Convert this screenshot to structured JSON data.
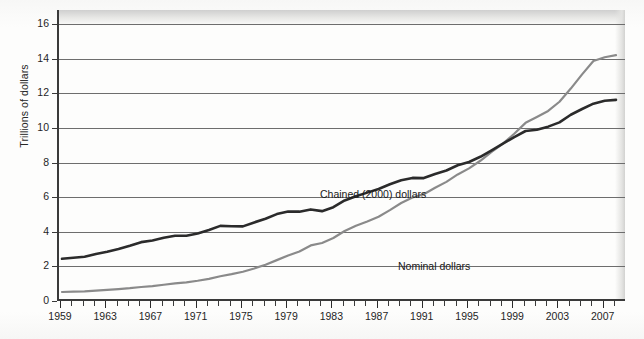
{
  "chart_data": {
    "type": "line",
    "title": "",
    "subtitle": "",
    "xlabel": "",
    "ylabel": "Trillions of dollars",
    "xlim": [
      1959,
      2008
    ],
    "ylim": [
      0,
      16
    ],
    "grid": true,
    "legend_position": "inline-annotation",
    "y_ticks": [
      0,
      2,
      4,
      6,
      8,
      10,
      12,
      14,
      16
    ],
    "y_tick_labels": [
      "0",
      "2",
      "4",
      "6",
      "8",
      "10",
      "12",
      "14",
      "16"
    ],
    "x_tick_labels": [
      "1959",
      "1963",
      "1967",
      "1971",
      "1975",
      "1979",
      "1983",
      "1987",
      "1991",
      "1995",
      "1999",
      "2003",
      "2007"
    ],
    "x_tick_values": [
      1959,
      1963,
      1967,
      1971,
      1975,
      1979,
      1983,
      1987,
      1991,
      1995,
      1999,
      2003,
      2007
    ],
    "x_minor_tick_interval": 1,
    "x": [
      1959,
      1960,
      1961,
      1962,
      1963,
      1964,
      1965,
      1966,
      1967,
      1968,
      1969,
      1970,
      1971,
      1972,
      1973,
      1974,
      1975,
      1976,
      1977,
      1978,
      1979,
      1980,
      1981,
      1982,
      1983,
      1984,
      1985,
      1986,
      1987,
      1988,
      1989,
      1990,
      1991,
      1992,
      1993,
      1994,
      1995,
      1996,
      1997,
      1998,
      1999,
      2000,
      2001,
      2002,
      2003,
      2004,
      2005,
      2006,
      2007,
      2008
    ],
    "series": [
      {
        "name": "Chained (2000) dollars",
        "color": "#2b2b2b",
        "line_width": 2.6,
        "values": [
          2.44,
          2.5,
          2.56,
          2.72,
          2.84,
          3.0,
          3.19,
          3.4,
          3.49,
          3.65,
          3.77,
          3.77,
          3.9,
          4.1,
          4.34,
          4.32,
          4.31,
          4.54,
          4.75,
          5.02,
          5.17,
          5.16,
          5.29,
          5.19,
          5.42,
          5.81,
          6.05,
          6.26,
          6.47,
          6.74,
          6.98,
          7.11,
          7.1,
          7.34,
          7.54,
          7.84,
          8.03,
          8.33,
          8.7,
          9.09,
          9.47,
          9.82,
          9.89,
          10.07,
          10.32,
          10.76,
          11.09,
          11.4,
          11.57,
          11.62
        ],
        "units": "trillions of chained 2000 dollars"
      },
      {
        "name": "Nominal dollars",
        "color": "#8a8a8a",
        "line_width": 2.2,
        "values": [
          0.52,
          0.54,
          0.56,
          0.6,
          0.64,
          0.69,
          0.74,
          0.81,
          0.86,
          0.94,
          1.02,
          1.08,
          1.17,
          1.28,
          1.43,
          1.55,
          1.69,
          1.88,
          2.09,
          2.36,
          2.63,
          2.86,
          3.21,
          3.35,
          3.64,
          4.04,
          4.35,
          4.59,
          4.87,
          5.25,
          5.66,
          5.98,
          6.17,
          6.54,
          6.88,
          7.31,
          7.66,
          8.1,
          8.61,
          9.09,
          9.66,
          10.29,
          10.63,
          10.98,
          11.51,
          12.27,
          13.09,
          13.86,
          14.08,
          14.2
        ],
        "units": "trillions of current dollars"
      }
    ],
    "annotations": [
      {
        "text": "Chained (2000) dollars",
        "near_year": 1981,
        "near_value": 7.2
      },
      {
        "text": "Nominal dollars",
        "near_year": 1987,
        "near_value": 3.2
      }
    ]
  },
  "axis": {
    "y_title": "Trillions of dollars"
  },
  "colors": {
    "chained_series": "#2b2b2b",
    "nominal_series": "#8a8a8a",
    "gridline": "#6d6d6d",
    "axis": "#3a3a3a",
    "text": "#1f1f1f",
    "page_background": "#fdfdfc"
  }
}
